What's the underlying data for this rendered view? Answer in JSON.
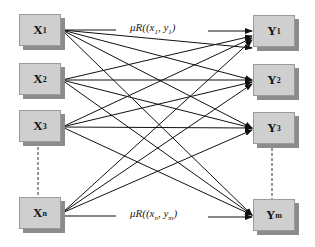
{
  "diagram": {
    "inputs": [
      {
        "base": "X",
        "sub": "1",
        "y": 14
      },
      {
        "base": "X",
        "sub": "2",
        "y": 63
      },
      {
        "base": "X",
        "sub": "3",
        "y": 110
      },
      {
        "base": "X",
        "sub": "n",
        "y": 197
      }
    ],
    "outputs": [
      {
        "base": "Y",
        "sub": "1",
        "y": 15
      },
      {
        "base": "Y",
        "sub": "2",
        "y": 64
      },
      {
        "base": "Y",
        "sub": "3",
        "y": 112
      },
      {
        "base": "Y",
        "sub": "m",
        "y": 199
      }
    ],
    "top_label": {
      "prefix": "μR((x",
      "sub1": "1",
      "mid": ", y",
      "sub2": "1",
      "suffix": ")"
    },
    "bottom_label": {
      "prefix": "μR((x",
      "sub1": "n",
      "mid": ", y",
      "sub2": "m",
      "suffix": ")"
    },
    "colors": {
      "node_fill": "#cfcfcf",
      "node_shadow": "#8c8c8c",
      "edge": "#111111"
    }
  }
}
